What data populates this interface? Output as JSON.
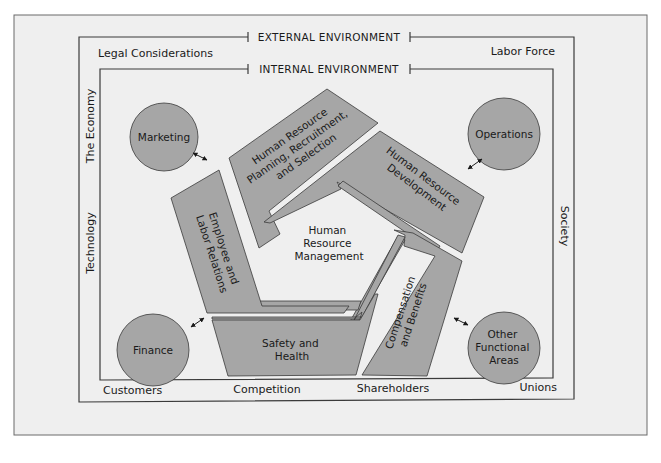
{
  "diagram": {
    "colors": {
      "page_bg": "#ffffff",
      "panel_bg": "#efefef",
      "shape_fill": "#a6a6a6",
      "stroke": "#3a3a3a",
      "text": "#1a1a1a"
    },
    "headers": {
      "external": "EXTERNAL ENVIRONMENT",
      "internal": "INTERNAL ENVIRONMENT"
    },
    "external_factors": {
      "top_left": "Legal Considerations",
      "top_right": "Labor Force",
      "left_upper": "The Economy",
      "left_lower": "Technology",
      "right": "Society",
      "bottom": [
        "Customers",
        "Competition",
        "Shareholders",
        "Unions"
      ]
    },
    "center": {
      "lines": [
        "Human",
        "Resource",
        "Management"
      ]
    },
    "functions": [
      {
        "id": "planning",
        "lines": [
          "Human Resource",
          "Planning, Recruitment,",
          "and Selection"
        ]
      },
      {
        "id": "development",
        "lines": [
          "Human Resource",
          "Development"
        ]
      },
      {
        "id": "compensation",
        "lines": [
          "Compensation",
          "and Benefits"
        ]
      },
      {
        "id": "safety",
        "lines": [
          "Safety and",
          "Health"
        ]
      },
      {
        "id": "employee",
        "lines": [
          "Employee and",
          "Labor Relations"
        ]
      }
    ],
    "internal_units": [
      {
        "id": "marketing",
        "lines": [
          "Marketing"
        ]
      },
      {
        "id": "operations",
        "lines": [
          "Operations"
        ]
      },
      {
        "id": "finance",
        "lines": [
          "Finance"
        ]
      },
      {
        "id": "other",
        "lines": [
          "Other",
          "Functional",
          "Areas"
        ]
      }
    ],
    "connectors": {
      "icon": "double-headed-arrow-icon",
      "count": 4
    }
  }
}
